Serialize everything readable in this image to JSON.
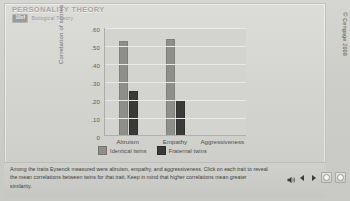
{
  "header": {
    "title": "PERSONALITY THEORY",
    "badge": "10of",
    "subtitle": "Biological Theory"
  },
  "chart_data": {
    "type": "bar",
    "title": "",
    "xlabel": "",
    "ylabel": "Correlation of scores",
    "categories": [
      "Altruism",
      "Empathy",
      "Aggressiveness"
    ],
    "ylim": [
      0,
      0.6
    ],
    "yticks": [
      "0",
      ".10",
      ".20",
      ".30",
      ".40",
      ".50",
      ".60"
    ],
    "ytick_values": [
      0,
      0.1,
      0.2,
      0.3,
      0.4,
      0.5,
      0.6
    ],
    "grid": true,
    "legend_position": "bottom",
    "series": [
      {
        "name": "Identical twins",
        "color": "#8e8e8a",
        "values": [
          0.53,
          0.54,
          null
        ]
      },
      {
        "name": "Fraternal twins",
        "color": "#3a3a38",
        "values": [
          0.25,
          0.2,
          null
        ]
      }
    ]
  },
  "legend": [
    {
      "label": "Identical twins"
    },
    {
      "label": "Fraternal twins"
    }
  ],
  "caption": {
    "text": "Among the traits Eysenck measured were altruism, empathy, and aggressiveness. Click on each trait to reveal the mean correlations between twins for that trait. Keep in mind that higher correlations mean greater similarity."
  },
  "controls": {
    "previous": "Previous",
    "play": "Play",
    "stop": "Stop",
    "next": "Next"
  },
  "copyright": "© Cengage 2008",
  "colors": {
    "identical": "#8e8e8a",
    "fraternal": "#3a3a38",
    "plot_bg": "#d3d3cf",
    "page_bg": "#cfcfcb"
  }
}
